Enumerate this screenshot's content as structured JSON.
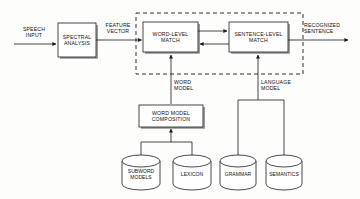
{
  "diagram": {
    "type": "block-diagram",
    "stroke_color": "#1a1a1a",
    "shadow_color": "#9a9a9a",
    "background_color": "#fdfdfb",
    "dashed_group_label": ""
  },
  "edge_labels": {
    "speech_input": "SPEECH\nINPUT",
    "feature_vector": "FEATURE\nVECTOR",
    "recognized_sentence": "RECOGNIZED\nSENTENCE",
    "word_model": "WORD\nMODEL",
    "language_model": "LANGUAGE\nMODEL"
  },
  "blocks": [
    {
      "id": "spectral_analysis",
      "label": "SPECTRAL\nANALYSIS"
    },
    {
      "id": "word_level_match",
      "label": "WORD-LEVEL\nMATCH"
    },
    {
      "id": "sentence_level_match",
      "label": "SENTENCE-LEVEL\nMATCH"
    },
    {
      "id": "word_model_composition",
      "label": "WORD MODEL\nCOMPOSITION"
    }
  ],
  "databases": [
    {
      "id": "subword_models",
      "label": "SUBWORD\nMODELS"
    },
    {
      "id": "lexicon",
      "label": "LEXICON"
    },
    {
      "id": "grammar",
      "label": "GRAMMAR"
    },
    {
      "id": "semantics",
      "label": "SEMANTICS"
    }
  ]
}
